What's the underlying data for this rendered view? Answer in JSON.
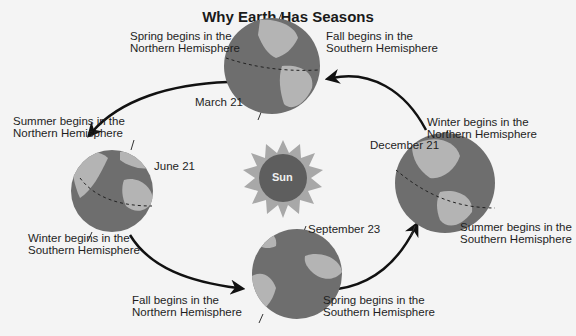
{
  "title": "Why Earth Has Seasons",
  "sun": {
    "label": "Sun"
  },
  "positions": [
    {
      "date": "March 21",
      "labels": [
        {
          "line1": "Spring begins in the",
          "line2": "Northern Hemisphere"
        },
        {
          "line1": "Fall begins in the",
          "line2": "Southern Hemisphere"
        }
      ]
    },
    {
      "date": "June 21",
      "labels": [
        {
          "line1": "Summer begins in the",
          "line2": "Northern Hemisphere"
        },
        {
          "line1": "Winter begins in the",
          "line2": "Southern Hemisphere"
        }
      ]
    },
    {
      "date": "September 23",
      "labels": [
        {
          "line1": "Fall begins in the",
          "line2": "Northern Hemisphere"
        },
        {
          "line1": "Spring begins in the",
          "line2": "Southern Hemisphere"
        }
      ]
    },
    {
      "date": "December 21",
      "labels": [
        {
          "line1": "Winter begins in the",
          "line2": "Northern Hemisphere"
        },
        {
          "line1": "Summer begins in the",
          "line2": "Southern Hemisphere"
        }
      ]
    }
  ],
  "colors": {
    "ocean": "#6e6e6e",
    "land": "#b4b4b4",
    "sun_core": "#5e5e5e",
    "sun_rays": "#a8a8a8",
    "arrow": "#111111"
  }
}
